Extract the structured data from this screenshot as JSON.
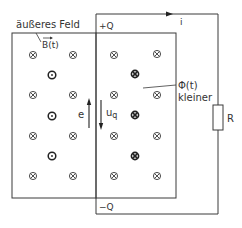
{
  "diagram": {
    "labels": {
      "external_field": "äußeres Feld",
      "b_field": "B(t)",
      "plus_charge": "+Q",
      "minus_charge": "−Q",
      "current": "i",
      "flux": "Φ(t)",
      "flux_note": "kleiner",
      "emf": "e",
      "source_voltage": "u",
      "source_voltage_sub": "q",
      "resistor": "R"
    },
    "colors": {
      "line": "#3a3a3a",
      "text": "#333333",
      "background": "#ffffff"
    },
    "symbols": {
      "into_page_count": 16,
      "out_of_page_count": 3,
      "bold_into_page_count": 3
    }
  }
}
